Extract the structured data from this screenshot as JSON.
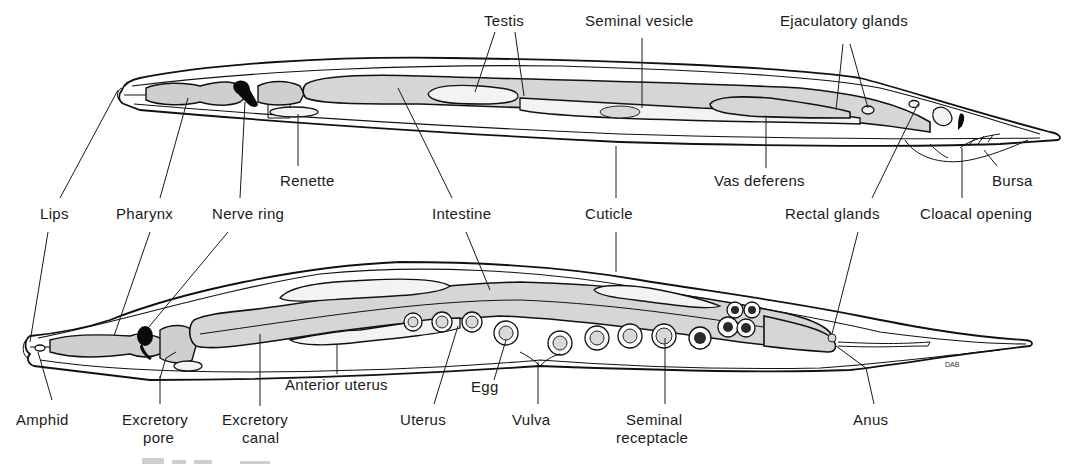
{
  "figure": {
    "signature": "DAB",
    "colors": {
      "ink": "#111111",
      "tissue_fill": "#d6d6d6",
      "background": "#ffffff"
    }
  },
  "male": {
    "labels": {
      "testis": "Testis",
      "seminal_vesicle": "Seminal vesicle",
      "ejaculatory_glands": "Ejaculatory glands",
      "renette": "Renette",
      "vas_deferens": "Vas deferens",
      "bursa": "Bursa"
    }
  },
  "shared_row": {
    "labels": {
      "lips": "Lips",
      "pharynx": "Pharynx",
      "nerve_ring": "Nerve ring",
      "intestine": "Intestine",
      "cuticle": "Cuticle",
      "rectal_glands": "Rectal glands",
      "cloacal_opening": "Cloacal opening"
    }
  },
  "female": {
    "labels": {
      "amphid": "Amphid",
      "excretory_pore_line1": "Excretory",
      "excretory_pore_line2": "pore",
      "excretory_canal_line1": "Excretory",
      "excretory_canal_line2": "canal",
      "anterior_uterus": "Anterior uterus",
      "uterus": "Uterus",
      "egg": "Egg",
      "vulva": "Vulva",
      "seminal_receptacle_line1": "Seminal",
      "seminal_receptacle_line2": "receptacle",
      "anus": "Anus"
    }
  }
}
